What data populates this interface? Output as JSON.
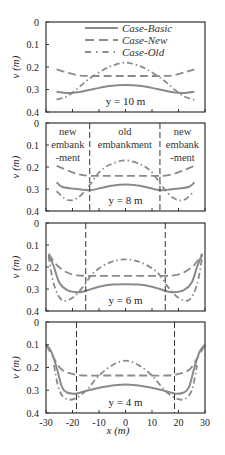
{
  "chart_data": {
    "type": "line",
    "xlabel": "x (m)",
    "ylabel": "v (m)",
    "xlim": [
      -30,
      30
    ],
    "ylim": [
      0,
      0.4
    ],
    "y_inverted": true,
    "x_ticks": [
      "-30",
      "-20",
      "-10",
      "0",
      "10",
      "20",
      "30"
    ],
    "x_tick_values": [
      -30,
      -20,
      -10,
      0,
      10,
      20,
      30
    ],
    "y_ticks": [
      "0",
      "0.1",
      "0.2",
      "0.3",
      "0.4"
    ],
    "y_tick_values": [
      0,
      0.1,
      0.2,
      0.3,
      0.4
    ],
    "grid": false,
    "legend": {
      "placement": "top-center",
      "entries": [
        {
          "name": "Case-Basic",
          "style": "solid"
        },
        {
          "name": "Case-New",
          "style": "dashed"
        },
        {
          "name": "Case-Old",
          "style": "dash-dot"
        }
      ]
    },
    "colors": {
      "Case-Basic": "#8a8a8a",
      "Case-New": "#8a8a8a",
      "Case-Old": "#8a8a8a",
      "axes": "#333333",
      "boundary": "#333333"
    },
    "panels": [
      {
        "label": "y = 10 m",
        "boundaries": [],
        "annotations": [],
        "series": [
          {
            "name": "Case-Basic",
            "x": [
              -26,
              -22,
              -18,
              -12,
              -6,
              0,
              6,
              12,
              18,
              22,
              26
            ],
            "values": [
              0.31,
              0.315,
              0.312,
              0.298,
              0.285,
              0.28,
              0.285,
              0.298,
              0.312,
              0.315,
              0.31
            ]
          },
          {
            "name": "Case-New",
            "x": [
              -26,
              -22,
              -18,
              -14,
              -8,
              0,
              8,
              14,
              18,
              22,
              26
            ],
            "values": [
              0.21,
              0.225,
              0.237,
              0.24,
              0.24,
              0.24,
              0.24,
              0.24,
              0.237,
              0.225,
              0.21
            ]
          },
          {
            "name": "Case-Old",
            "x": [
              -26,
              -22,
              -18,
              -14,
              -8,
              -4,
              0,
              4,
              8,
              14,
              18,
              22,
              26
            ],
            "values": [
              0.345,
              0.33,
              0.295,
              0.255,
              0.21,
              0.19,
              0.18,
              0.19,
              0.21,
              0.255,
              0.295,
              0.33,
              0.345
            ]
          }
        ]
      },
      {
        "label": "y = 8 m",
        "boundaries": [
          -13.5,
          13
        ],
        "annotations": [
          {
            "text": [
              "new",
              "embank",
              "-ment"
            ],
            "region": "left"
          },
          {
            "text": [
              "old",
              "embankment"
            ],
            "region": "center"
          },
          {
            "text": [
              "new",
              "embank",
              "-ment"
            ],
            "region": "right"
          }
        ],
        "series": [
          {
            "name": "Case-Basic",
            "x": [
              -26,
              -24,
              -20,
              -16,
              -13,
              -8,
              -4,
              0,
              4,
              8,
              13,
              16,
              20,
              24,
              26
            ],
            "values": [
              0.27,
              0.29,
              0.298,
              0.303,
              0.305,
              0.292,
              0.283,
              0.28,
              0.283,
              0.292,
              0.305,
              0.303,
              0.298,
              0.29,
              0.27
            ]
          },
          {
            "name": "Case-New",
            "x": [
              -26,
              -22,
              -18,
              -14,
              -8,
              0,
              8,
              14,
              18,
              22,
              26
            ],
            "values": [
              0.195,
              0.215,
              0.232,
              0.24,
              0.24,
              0.24,
              0.24,
              0.24,
              0.232,
              0.215,
              0.195
            ]
          },
          {
            "name": "Case-Old",
            "x": [
              -26,
              -22,
              -18,
              -14,
              -10,
              -6,
              0,
              6,
              10,
              14,
              18,
              22,
              26
            ],
            "values": [
              0.31,
              0.35,
              0.34,
              0.29,
              0.225,
              0.19,
              0.17,
              0.19,
              0.225,
              0.29,
              0.34,
              0.35,
              0.31
            ]
          }
        ]
      },
      {
        "label": "y = 6 m",
        "boundaries": [
          -15,
          15
        ],
        "annotations": [],
        "series": [
          {
            "name": "Case-Basic",
            "x": [
              -29,
              -27,
              -25,
              -22,
              -18,
              -15,
              -10,
              -5,
              0,
              5,
              10,
              15,
              18,
              22,
              25,
              27,
              29
            ],
            "values": [
              0.14,
              0.2,
              0.27,
              0.305,
              0.315,
              0.308,
              0.29,
              0.28,
              0.278,
              0.28,
              0.29,
              0.308,
              0.315,
              0.305,
              0.27,
              0.2,
              0.14
            ]
          },
          {
            "name": "Case-New",
            "x": [
              -29,
              -26,
              -22,
              -18,
              -15,
              -8,
              0,
              8,
              15,
              18,
              22,
              26,
              29
            ],
            "values": [
              0.14,
              0.19,
              0.225,
              0.238,
              0.24,
              0.24,
              0.24,
              0.24,
              0.24,
              0.238,
              0.225,
              0.19,
              0.14
            ]
          },
          {
            "name": "Case-Old",
            "x": [
              -29,
              -27,
              -24,
              -20,
              -16,
              -12,
              -6,
              0,
              6,
              12,
              16,
              20,
              24,
              27,
              29
            ],
            "values": [
              0.15,
              0.28,
              0.35,
              0.34,
              0.29,
              0.225,
              0.18,
              0.165,
              0.18,
              0.225,
              0.29,
              0.34,
              0.35,
              0.28,
              0.15
            ]
          }
        ]
      },
      {
        "label": "y = 4 m",
        "boundaries": [
          -18.5,
          18.5
        ],
        "annotations": [],
        "series": [
          {
            "name": "Case-Basic",
            "x": [
              -30,
              -28,
              -26,
              -24,
              -22,
              -19,
              -14,
              -8,
              0,
              8,
              14,
              19,
              22,
              24,
              26,
              28,
              30
            ],
            "values": [
              0.1,
              0.13,
              0.2,
              0.285,
              0.31,
              0.315,
              0.3,
              0.285,
              0.275,
              0.285,
              0.3,
              0.315,
              0.31,
              0.285,
              0.2,
              0.13,
              0.1
            ]
          },
          {
            "name": "Case-New",
            "x": [
              -30,
              -27,
              -24,
              -20,
              -16,
              -8,
              0,
              8,
              16,
              20,
              24,
              27,
              30
            ],
            "values": [
              0.1,
              0.16,
              0.21,
              0.228,
              0.235,
              0.235,
              0.235,
              0.235,
              0.235,
              0.228,
              0.21,
              0.16,
              0.1
            ]
          },
          {
            "name": "Case-Old",
            "x": [
              -27,
              -25,
              -22,
              -18,
              -14,
              -10,
              -5,
              0,
              5,
              10,
              14,
              18,
              22,
              25,
              27
            ],
            "values": [
              0.19,
              0.3,
              0.34,
              0.33,
              0.29,
              0.235,
              0.19,
              0.17,
              0.19,
              0.235,
              0.29,
              0.33,
              0.34,
              0.3,
              0.19
            ]
          }
        ]
      }
    ]
  }
}
